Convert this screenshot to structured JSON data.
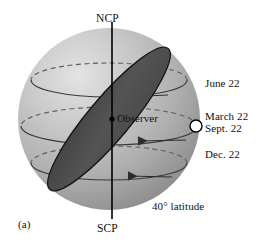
{
  "figure": {
    "panel_label": "(a)",
    "caption_latitude": "40° latitude"
  },
  "poles": {
    "north": "NCP",
    "south": "SCP"
  },
  "observer": {
    "label": "Observer"
  },
  "sun_positions": [
    {
      "id": "june-solstice",
      "label": "June 22"
    },
    {
      "id": "march-equinox",
      "label": "March 22"
    },
    {
      "id": "september-equinox",
      "label": "Sept. 22"
    },
    {
      "id": "december-solstice",
      "label": "Dec. 22"
    }
  ],
  "colors": {
    "background": "#ffffff",
    "sphere_light": "#d6d6d6",
    "sphere_mid": "#b4b4b4",
    "sphere_dark": "#9a9a9a",
    "horizon_plane": "#4e4e4e",
    "horizon_plane_edge": "#111111",
    "axis": "#000000",
    "path_line": "#3a3a3a",
    "dashed_line": "#5a5a5a",
    "sun_fill": "#ffffff",
    "sun_stroke": "#000000",
    "text": "#111111"
  },
  "geometry": {
    "sphere_center_x": 109,
    "sphere_center_y": 119,
    "sphere_radius": 91,
    "axis_top_y": 22,
    "axis_bottom_y": 219,
    "horizon_tilt_deg": -50,
    "horizon_semi_major": 92,
    "horizon_semi_minor": 21,
    "sun_x": 196,
    "sun_y": 126,
    "sun_radius": 6,
    "declination_circles": [
      {
        "id": "june-path",
        "cy": 80,
        "rx": 78,
        "ry": 17
      },
      {
        "id": "equinox-path",
        "cy": 126,
        "rx": 88,
        "ry": 19
      },
      {
        "id": "dec-path",
        "cy": 163,
        "rx": 78,
        "ry": 17
      }
    ]
  }
}
